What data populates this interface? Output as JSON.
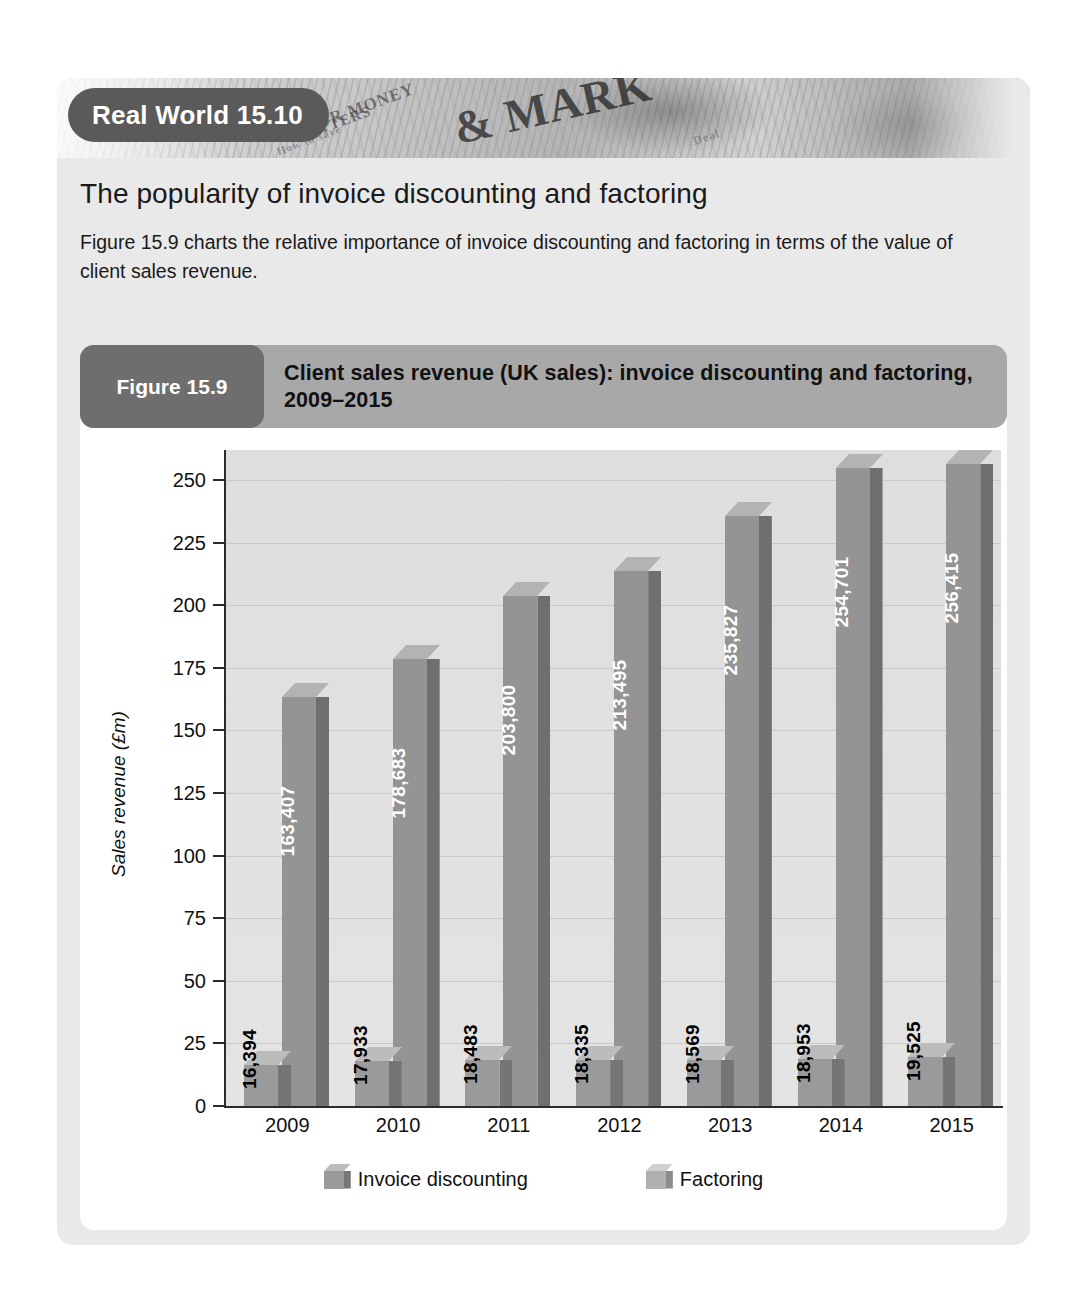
{
  "box": {
    "badge_label": "Real World 15.10",
    "heading": "The popularity of invoice discounting and factoring",
    "paragraph": "Figure 15.9 charts the relative importance of invoice discounting and factoring in terms of the value of client sales revenue."
  },
  "figure": {
    "pill_label": "Figure 15.9",
    "title": "Client sales revenue (UK sales): invoice discounting and factoring, 2009–2015"
  },
  "colors": {
    "card_bg": "#e9e9e9",
    "badge_bg": "#5a5a5a",
    "fig_bar_bg": "#a8a8a8",
    "fig_pill_bg": "#6e6e6e",
    "plot_bg": "#e0e0e0",
    "series_invoice": "#949494",
    "series_factoring": "#9a9a9a"
  },
  "chart_data": {
    "type": "bar",
    "title": "Client sales revenue (UK sales): invoice discounting and factoring, 2009–2015",
    "xlabel": "",
    "ylabel": "Sales revenue (£m)",
    "ylim": [
      0,
      262
    ],
    "yticks": [
      0,
      25,
      50,
      75,
      100,
      125,
      150,
      175,
      200,
      225,
      250
    ],
    "ytick_labels": [
      "0",
      "25",
      "50",
      "75",
      "100",
      "125",
      "150",
      "175",
      "200",
      "225",
      "250"
    ],
    "grid": true,
    "legend_position": "bottom",
    "categories": [
      "2009",
      "2010",
      "2011",
      "2012",
      "2013",
      "2014",
      "2015"
    ],
    "series": [
      {
        "name": "Factoring",
        "values": [
          16.394,
          17.933,
          18.483,
          18.335,
          18.569,
          18.953,
          19.525
        ],
        "labels": [
          "16,394",
          "17,933",
          "18,483",
          "18,335",
          "18,569",
          "18,953",
          "19,525"
        ],
        "label_color": "#000000",
        "label_placement": "outside"
      },
      {
        "name": "Invoice discounting",
        "values": [
          163.407,
          178.683,
          203.8,
          213.495,
          235.827,
          254.701,
          256.415
        ],
        "labels": [
          "163,407",
          "178,683",
          "203,800",
          "213,495",
          "235,827",
          "254,701",
          "256,415"
        ],
        "label_color": "#ffffff",
        "label_placement": "inside"
      }
    ]
  },
  "legend": {
    "items": [
      {
        "label": "Invoice discounting"
      },
      {
        "label": "Factoring"
      }
    ]
  },
  "newspaper": {
    "words": [
      "UR MONEY",
      "MATTERS",
      "How to save",
      "& MARK",
      "Deal"
    ]
  }
}
